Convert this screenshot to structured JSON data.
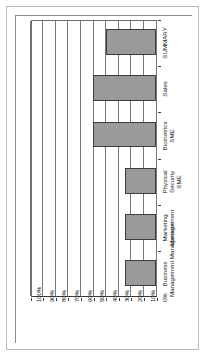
{
  "chart_data": {
    "type": "bar",
    "orientation": "horizontal",
    "title": "",
    "subtitle": "",
    "xlabel": "",
    "ylabel": "",
    "categories": [
      "Business\nManagement Management",
      "Marketing\nManagement",
      "Physical\nSecurity\nSME",
      "Biometrics\nSME",
      "Sales",
      "SUMMARY"
    ],
    "category_labels": [
      {
        "line1": "Business",
        "line2": "Management Management"
      },
      {
        "line1": "Marketing",
        "line2": "Management"
      },
      {
        "line1": "Physical",
        "line2": "Security",
        "line3": "SME"
      },
      {
        "line1": "Biometrics",
        "line2": "SME"
      },
      {
        "line1": "Sales"
      },
      {
        "line1": "SUMMARY"
      }
    ],
    "values": [
      25,
      25,
      25,
      50,
      50,
      40
    ],
    "value_unit": "%",
    "xlim": [
      0,
      100
    ],
    "tick_labels": [
      "100%",
      "90%",
      "80%",
      "70%",
      "60%",
      "50%",
      "40%",
      "30%",
      "20%",
      "10%",
      "0%"
    ],
    "tick_values": [
      100,
      90,
      80,
      70,
      60,
      50,
      40,
      30,
      20,
      10,
      0
    ],
    "grid": true,
    "grid_axis": "value",
    "legend": false,
    "legend_position": "none",
    "series": [
      {
        "name": "",
        "values": [
          25,
          25,
          25,
          50,
          50,
          40
        ]
      }
    ],
    "colors": {
      "bar_fill": "#9a9a9a",
      "bar_border": "#3d3d3d",
      "gridline": "#777777",
      "axis": "#3a3a3a",
      "text": "#1a1a1a",
      "frame": "#b9b9b9",
      "background": "#ffffff"
    }
  }
}
